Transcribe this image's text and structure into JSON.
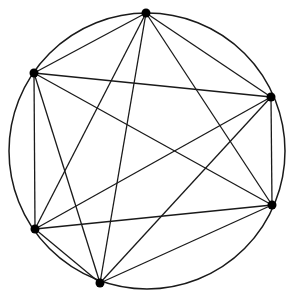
{
  "diagram": {
    "type": "complete-graph-inscribed-in-circle",
    "circle": {
      "cx": 147,
      "cy": 151,
      "r": 138
    },
    "stroke_color": "#1a1a1a",
    "point_color": "#000000",
    "points": [
      {
        "id": "A",
        "x": 146,
        "y": 13
      },
      {
        "id": "B",
        "x": 271,
        "y": 97
      },
      {
        "id": "C",
        "x": 272,
        "y": 205
      },
      {
        "id": "D",
        "x": 100,
        "y": 283
      },
      {
        "id": "E",
        "x": 35,
        "y": 229
      },
      {
        "id": "F",
        "x": 34,
        "y": 73
      }
    ],
    "edges": [
      [
        "A",
        "B"
      ],
      [
        "A",
        "C"
      ],
      [
        "A",
        "D"
      ],
      [
        "A",
        "E"
      ],
      [
        "A",
        "F"
      ],
      [
        "B",
        "C"
      ],
      [
        "B",
        "D"
      ],
      [
        "B",
        "E"
      ],
      [
        "B",
        "F"
      ],
      [
        "C",
        "D"
      ],
      [
        "C",
        "E"
      ],
      [
        "C",
        "F"
      ],
      [
        "D",
        "E"
      ],
      [
        "D",
        "F"
      ],
      [
        "E",
        "F"
      ]
    ]
  }
}
